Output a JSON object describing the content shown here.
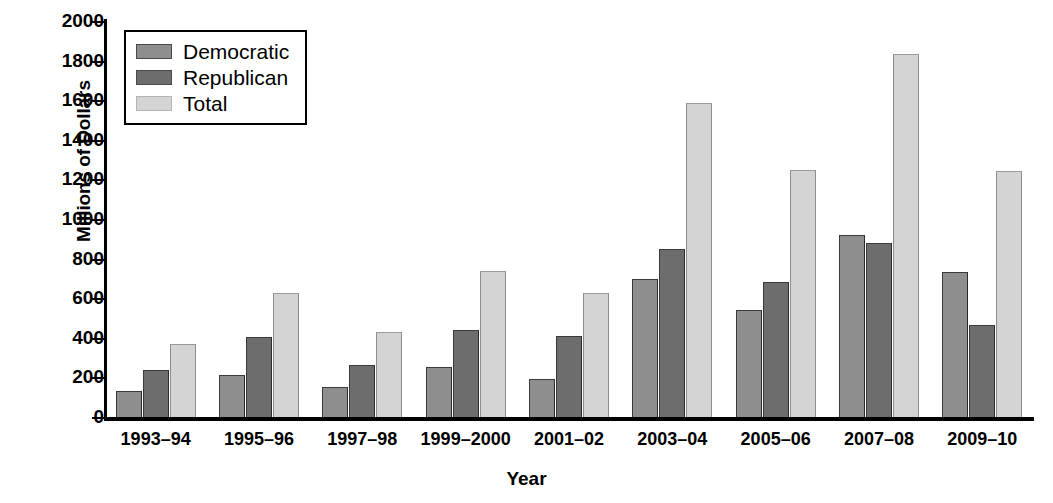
{
  "chart_data": {
    "type": "bar",
    "title": "",
    "xlabel": "Year",
    "ylabel": "Millions of Dollars",
    "ylim": [
      0,
      2000
    ],
    "yticks": [
      2000,
      1800,
      1600,
      1400,
      1200,
      1000,
      800,
      600,
      400,
      200,
      0
    ],
    "ytick_labels": [
      "2000",
      "1800",
      "1600",
      "1400",
      "1200",
      "1000",
      "800",
      "600",
      "400",
      "200",
      "0"
    ],
    "grid": false,
    "legend_position": "upper-left",
    "categories": [
      "1993–94",
      "1995–96",
      "1997–98",
      "1999–2000",
      "2001–02",
      "2003–04",
      "2005–06",
      "2007–08",
      "2009–10"
    ],
    "series": [
      {
        "name": "Democratic",
        "color": "#8e8e8e",
        "values": [
          130,
          210,
          150,
          255,
          190,
          695,
          540,
          920,
          730
        ]
      },
      {
        "name": "Republican",
        "color": "#6d6d6d",
        "values": [
          235,
          405,
          265,
          440,
          410,
          850,
          680,
          880,
          465
        ]
      },
      {
        "name": "Total",
        "color": "#d4d4d4",
        "values": [
          370,
          625,
          430,
          735,
          625,
          1585,
          1250,
          1835,
          1240
        ]
      }
    ]
  },
  "legend": {
    "items": [
      {
        "label": "Democratic",
        "swatch": "dem"
      },
      {
        "label": "Republican",
        "swatch": "rep"
      },
      {
        "label": "Total",
        "swatch": "tot"
      }
    ]
  },
  "axes": {
    "y_title": "Millions of Dollars",
    "x_title": "Year"
  }
}
